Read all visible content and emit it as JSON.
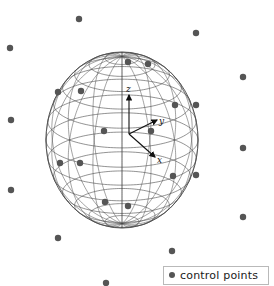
{
  "figure": {
    "title": "",
    "background_color": "#ffffff",
    "width": 274,
    "height": 286
  },
  "legend": {
    "label": "control points",
    "marker": "filled-circle",
    "marker_color": "#555555",
    "border_color": "#b9b9b9",
    "x": 163,
    "y": 266,
    "width": 106,
    "height": 19
  },
  "axes_triad": {
    "origin": [
      129,
      134
    ],
    "labels": {
      "z": "z",
      "y": "y",
      "x": "x"
    },
    "arrows": [
      {
        "name": "z-axis",
        "from": [
          129,
          134
        ],
        "to": [
          129,
          95
        ],
        "label": "z",
        "label_pos": [
          126,
          92
        ]
      },
      {
        "name": "y-axis",
        "from": [
          129,
          134
        ],
        "to": [
          157,
          120
        ],
        "label": "y",
        "label_pos": [
          159,
          124
        ]
      },
      {
        "name": "x-axis",
        "from": [
          129,
          134
        ],
        "to": [
          155,
          157
        ],
        "label": "x",
        "label_pos": [
          157,
          163
        ]
      }
    ],
    "color": "#111111"
  },
  "chart_data": {
    "type": "scatter",
    "title": "",
    "xlabel": "",
    "ylabel": "",
    "sphere": {
      "center": [
        122,
        140
      ],
      "radius_x": 76,
      "radius_y": 88,
      "line_color": "#4a4a4a",
      "latitude_count": 13,
      "longitude_count": 16,
      "tilt_deg": 18
    },
    "point_color": "#555555",
    "point_radius": 3.2,
    "points_on_sphere": [
      [
        128,
        62
      ],
      [
        148,
        64
      ],
      [
        105,
        202
      ],
      [
        128,
        206
      ],
      [
        58,
        92
      ],
      [
        81,
        91
      ],
      [
        60,
        163
      ],
      [
        80,
        163
      ],
      [
        104,
        131
      ],
      [
        151,
        131
      ],
      [
        175,
        105
      ],
      [
        196,
        105
      ],
      [
        173,
        176
      ],
      [
        196,
        175
      ]
    ],
    "points_outside": [
      [
        79,
        19
      ],
      [
        196,
        33
      ],
      [
        10,
        48
      ],
      [
        243,
        77
      ],
      [
        11,
        120
      ],
      [
        243,
        148
      ],
      [
        11,
        190
      ],
      [
        243,
        217
      ],
      [
        58,
        238
      ],
      [
        172,
        251
      ],
      [
        106,
        283
      ]
    ]
  }
}
